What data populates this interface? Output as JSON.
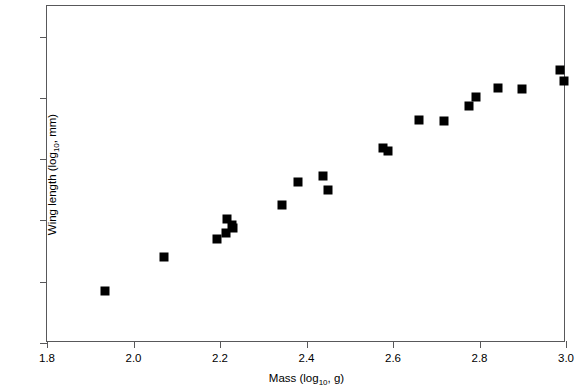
{
  "chart_data": {
    "type": "scatter",
    "title": "",
    "xlabel": "Mass (log10, g)",
    "ylabel": "Wing length (log10, mm)",
    "xlabel_parts": {
      "prefix": "Mass (log",
      "sub": "10",
      "suffix": ", g)"
    },
    "ylabel_parts": {
      "prefix": "Wing length (log",
      "sub": "10",
      "suffix": ", mm)"
    },
    "xlim": [
      1.8,
      3.0
    ],
    "ylim": [
      1.9,
      2.45
    ],
    "xticks": [
      "1.8",
      "2.0",
      "2.2",
      "2.4",
      "2.6",
      "2.8",
      "3.0"
    ],
    "xtick_values": [
      1.8,
      2.0,
      2.2,
      2.4,
      2.6,
      2.8,
      3.0
    ],
    "yticks": [
      "1.9",
      "2.0",
      "2.1",
      "2.2",
      "2.3",
      "2.4"
    ],
    "ytick_values": [
      1.9,
      2.0,
      2.1,
      2.2,
      2.3,
      2.4
    ],
    "grid": false,
    "legend": false,
    "marker": "square",
    "marker_color": "#000000",
    "marker_size": 9,
    "axis_color": "#58585a",
    "n_points": 21,
    "x": [
      1.934,
      2.071,
      2.192,
      2.213,
      2.217,
      2.229,
      2.344,
      2.381,
      2.437,
      2.449,
      2.576,
      2.588,
      2.659,
      2.719,
      2.776,
      2.791,
      2.843,
      2.899,
      2.985,
      2.995,
      2.228
    ],
    "y": [
      1.985,
      2.04,
      2.069,
      2.08,
      2.103,
      2.088,
      2.125,
      2.162,
      2.172,
      2.15,
      2.218,
      2.213,
      2.264,
      2.262,
      2.286,
      2.302,
      2.316,
      2.315,
      2.345,
      2.327,
      2.093
    ],
    "points": [
      {
        "x": 1.934,
        "y": 1.985
      },
      {
        "x": 2.071,
        "y": 2.04
      },
      {
        "x": 2.192,
        "y": 2.069
      },
      {
        "x": 2.213,
        "y": 2.08
      },
      {
        "x": 2.217,
        "y": 2.103
      },
      {
        "x": 2.228,
        "y": 2.093
      },
      {
        "x": 2.229,
        "y": 2.088
      },
      {
        "x": 2.344,
        "y": 2.125
      },
      {
        "x": 2.381,
        "y": 2.162
      },
      {
        "x": 2.437,
        "y": 2.172
      },
      {
        "x": 2.449,
        "y": 2.15
      },
      {
        "x": 2.576,
        "y": 2.218
      },
      {
        "x": 2.588,
        "y": 2.213
      },
      {
        "x": 2.659,
        "y": 2.264
      },
      {
        "x": 2.719,
        "y": 2.262
      },
      {
        "x": 2.776,
        "y": 2.286
      },
      {
        "x": 2.791,
        "y": 2.302
      },
      {
        "x": 2.843,
        "y": 2.316
      },
      {
        "x": 2.899,
        "y": 2.315
      },
      {
        "x": 2.985,
        "y": 2.345
      },
      {
        "x": 2.995,
        "y": 2.327
      }
    ]
  }
}
